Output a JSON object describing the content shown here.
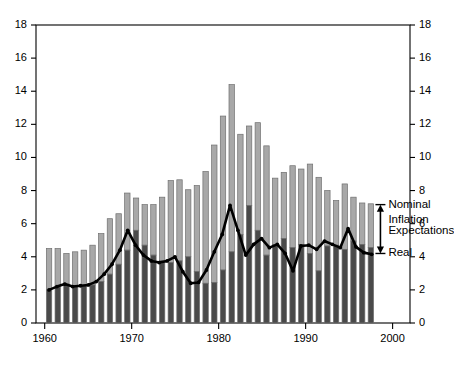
{
  "chart_data": {
    "type": "bar",
    "title": "",
    "subtitle": "",
    "xlabel": "",
    "ylabel": "",
    "xlim": [
      1959.0,
      2002.0
    ],
    "ylim": [
      0,
      18
    ],
    "grid": false,
    "legend_position": "inline-annotation-right",
    "y_ticks": [
      0,
      2,
      4,
      6,
      8,
      10,
      12,
      14,
      16,
      18
    ],
    "y_ticks_right": [
      0,
      2,
      4,
      6,
      8,
      10,
      12,
      14,
      16,
      18
    ],
    "x_ticks": [
      1960,
      1970,
      1980,
      1990,
      2000
    ],
    "x_tick_labels": [
      "1960",
      "1970",
      "1980",
      "1990",
      "2000"
    ],
    "dual_axis": true,
    "series": [
      {
        "name": "Nominal",
        "type": "bar",
        "note": "Bar total height = nominal interest rate",
        "values": [
          4.5,
          4.5,
          4.2,
          4.3,
          4.4,
          4.7,
          5.4,
          6.3,
          6.6,
          7.85,
          7.55,
          7.15,
          7.15,
          7.6,
          8.6,
          8.65,
          8.05,
          8.3,
          9.15,
          10.75,
          12.5,
          14.4,
          11.4,
          11.9,
          12.1,
          10.7,
          8.75,
          9.1,
          9.5,
          9.3,
          9.6,
          8.8,
          8.0,
          7.4,
          8.4,
          7.6,
          7.25,
          7.2
        ]
      },
      {
        "name": "Real",
        "type": "line",
        "note": "Black line = real interest rate; shading below line is dark, above is light",
        "values": [
          2.0,
          2.2,
          2.35,
          2.2,
          2.25,
          2.3,
          2.5,
          2.95,
          3.55,
          4.4,
          5.6,
          4.7,
          4.1,
          3.75,
          3.65,
          3.75,
          4.0,
          3.1,
          2.4,
          2.45,
          3.2,
          4.3,
          5.35,
          7.1,
          5.6,
          4.1,
          4.75,
          5.1,
          4.55,
          4.75,
          4.2,
          3.15,
          4.65,
          4.7,
          4.45,
          4.95,
          4.75,
          4.55,
          5.7,
          4.6,
          4.25,
          4.15
        ]
      }
    ],
    "bars_start_year": 1960,
    "bars_end_year": 1997,
    "annotations": [
      {
        "name": "nominal-label",
        "text": "Nominal",
        "anchor_value": 7.2
      },
      {
        "name": "inflation-label1",
        "text": "Inflation",
        "anchor_value": 6.1
      },
      {
        "name": "inflation-label2",
        "text": "Expectations",
        "anchor_value": 5.5
      },
      {
        "name": "real-label",
        "text": "Real",
        "anchor_value": 4.2
      },
      {
        "name": "gap-arrow",
        "text": "",
        "anchor_value": 5.7
      }
    ],
    "colors": {
      "bar_upper": "#a8a8a8",
      "bar_lower": "#4a4a4a",
      "bar_edge": "#6f6f6f",
      "line": "#000000",
      "axis": "#000000",
      "background": "#ffffff"
    }
  }
}
